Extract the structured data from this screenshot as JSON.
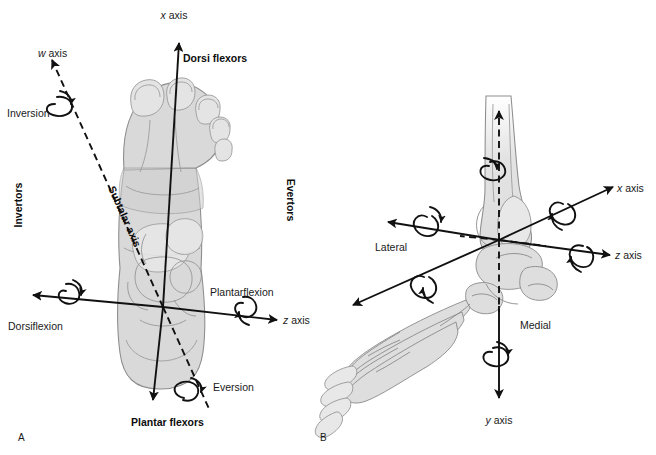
{
  "figure": {
    "panels": [
      {
        "id": "A",
        "label": "A",
        "view": "dorsal-view-of-foot",
        "labels": {
          "x_axis": {
            "symbol": "x",
            "word": " axis"
          },
          "w_axis": {
            "symbol": "w",
            "word": " axis"
          },
          "z_axis": {
            "symbol": "z",
            "word": " axis"
          },
          "dorsi_flexors": "Dorsi flexors",
          "plantar_flexors": "Plantar flexors",
          "inversion": "Inversion",
          "eversion": "Eversion",
          "dorsiflexion": "Dorsiflexion",
          "plantarflexion": "Plantarflexion",
          "invertors": "Invertors",
          "evertors": "Evertors",
          "subtalar_axis": "Subtalar axis"
        }
      },
      {
        "id": "B",
        "label": "B",
        "view": "medial-oblique-view-of-foot-and-ankle",
        "labels": {
          "x_axis": {
            "symbol": "x",
            "word": " axis"
          },
          "y_axis": {
            "symbol": "y",
            "word": " axis"
          },
          "z_axis": {
            "symbol": "z",
            "word": " axis"
          },
          "lateral": "Lateral",
          "medial": "Medial"
        }
      }
    ],
    "colors": {
      "background": "#ffffff",
      "ink": "#111111",
      "skin_fill": "#d9d9d9",
      "skin_stroke": "#8e8e8e",
      "bone_fill": "#dedede",
      "bone_stroke": "#8a8a8a"
    }
  }
}
